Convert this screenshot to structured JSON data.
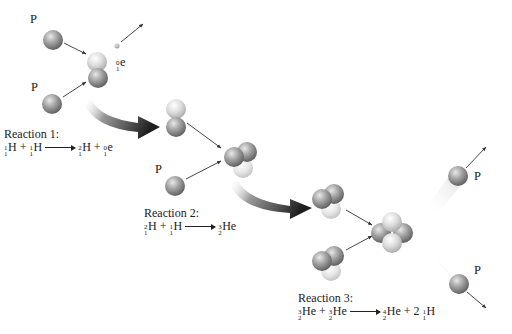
{
  "diagram": {
    "particle_labels": {
      "proton": "P",
      "positron_symbol": "e",
      "positron_mass": "0",
      "positron_charge": "1"
    },
    "reactions": [
      {
        "label": "Reaction 1:",
        "reactants": [
          {
            "mass": "1",
            "charge": "1",
            "symbol": "H",
            "coef": ""
          },
          {
            "mass": "1",
            "charge": "1",
            "symbol": "H",
            "coef": ""
          }
        ],
        "products": [
          {
            "mass": "2",
            "charge": "1",
            "symbol": "H",
            "coef": ""
          },
          {
            "mass": "0",
            "charge": "1",
            "symbol": "e",
            "coef": ""
          }
        ]
      },
      {
        "label": "Reaction 2:",
        "reactants": [
          {
            "mass": "2",
            "charge": "1",
            "symbol": "H",
            "coef": ""
          },
          {
            "mass": "1",
            "charge": "1",
            "symbol": "H",
            "coef": ""
          }
        ],
        "products": [
          {
            "mass": "3",
            "charge": "2",
            "symbol": "He",
            "coef": ""
          }
        ]
      },
      {
        "label": "Reaction 3:",
        "reactants": [
          {
            "mass": "3",
            "charge": "2",
            "symbol": "He",
            "coef": ""
          },
          {
            "mass": "3",
            "charge": "2",
            "symbol": "He",
            "coef": ""
          }
        ],
        "products": [
          {
            "mass": "4",
            "charge": "2",
            "symbol": "He",
            "coef": ""
          },
          {
            "mass": "1",
            "charge": "1",
            "symbol": "H",
            "coef": "2"
          }
        ]
      }
    ],
    "operators": {
      "plus": "+",
      "space": " "
    },
    "colors": {
      "proton_dark": "#6e6e6e",
      "proton_mid": "#a8a8a8",
      "proton_light": "#e4e4e4",
      "neutron_light": "#f2f2f2",
      "curved_arrow": "#2a2a2a",
      "line_arrow": "#333333",
      "background": "#ffffff"
    }
  }
}
